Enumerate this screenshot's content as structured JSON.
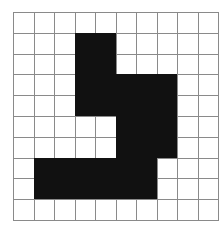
{
  "grid": {
    "rows": 10,
    "cols": 10,
    "colors": {
      "filled": "#111111",
      "empty": "#ffffff",
      "line": "#8a8a8a"
    },
    "filled_cells": [
      [
        1,
        3
      ],
      [
        1,
        4
      ],
      [
        2,
        3
      ],
      [
        2,
        4
      ],
      [
        3,
        3
      ],
      [
        3,
        4
      ],
      [
        3,
        5
      ],
      [
        3,
        6
      ],
      [
        3,
        7
      ],
      [
        4,
        3
      ],
      [
        4,
        4
      ],
      [
        4,
        5
      ],
      [
        4,
        6
      ],
      [
        4,
        7
      ],
      [
        5,
        5
      ],
      [
        5,
        6
      ],
      [
        5,
        7
      ],
      [
        6,
        5
      ],
      [
        6,
        6
      ],
      [
        6,
        7
      ],
      [
        7,
        1
      ],
      [
        7,
        2
      ],
      [
        7,
        3
      ],
      [
        7,
        4
      ],
      [
        7,
        5
      ],
      [
        7,
        6
      ],
      [
        8,
        1
      ],
      [
        8,
        2
      ],
      [
        8,
        3
      ],
      [
        8,
        4
      ],
      [
        8,
        5
      ],
      [
        8,
        6
      ]
    ]
  }
}
